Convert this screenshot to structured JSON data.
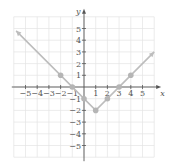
{
  "chart_data": {
    "type": "line",
    "title": "",
    "function": "y = |x - 1| - 2",
    "xlabel": "x",
    "ylabel": "y",
    "xlim": [
      -6,
      6
    ],
    "ylim": [
      -6,
      6
    ],
    "grid": true,
    "x_ticks": [
      "-5",
      "-4",
      "-3",
      "-2",
      "-1",
      "1",
      "2",
      "3",
      "4",
      "5"
    ],
    "y_ticks": [
      "5",
      "4",
      "3",
      "2",
      "1",
      "-1",
      "-2",
      "-3",
      "-4",
      "-5"
    ],
    "series": [
      {
        "name": "y = |x-1| - 2",
        "x": [
          -5.8,
          1,
          6
        ],
        "y": [
          4.8,
          -2,
          3
        ],
        "arrows": "both"
      }
    ],
    "points": [
      {
        "x": -2,
        "y": 1
      },
      {
        "x": -1,
        "y": 0
      },
      {
        "x": 0,
        "y": -1
      },
      {
        "x": 1,
        "y": -2
      },
      {
        "x": 2,
        "y": -1
      },
      {
        "x": 3,
        "y": 0
      },
      {
        "x": 4,
        "y": 1
      }
    ],
    "colors": {
      "line": "#bdbdbd",
      "points": "#b5b5b5",
      "grid": "#e4e4e4",
      "axis": "#555555"
    }
  }
}
